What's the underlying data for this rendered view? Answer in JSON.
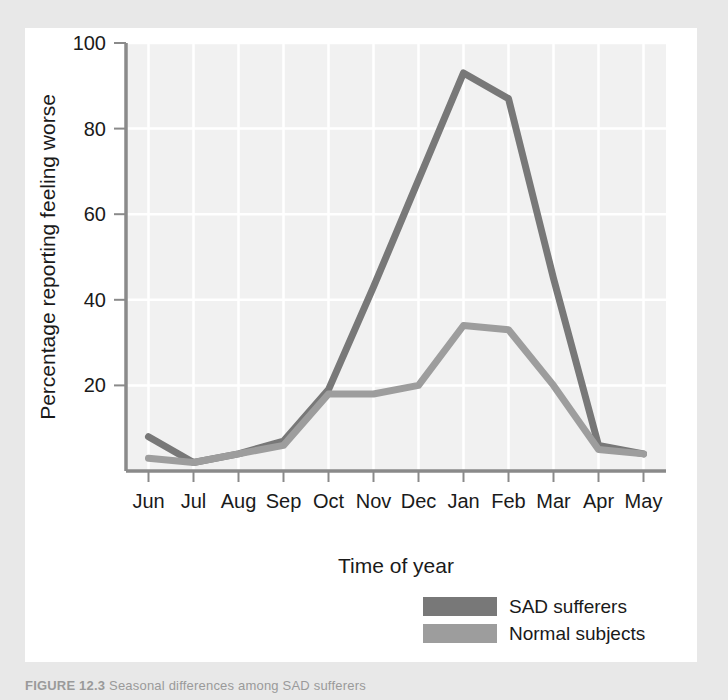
{
  "figure": {
    "caption_label": "FIGURE 12.3",
    "caption_text": "Seasonal differences among SAD sufferers"
  },
  "chart_data": {
    "type": "line",
    "title": "",
    "xlabel": "Time of year",
    "ylabel": "Percentage reporting feeling worse",
    "categories": [
      "Jun",
      "Jul",
      "Aug",
      "Sep",
      "Oct",
      "Nov",
      "Dec",
      "Jan",
      "Feb",
      "Mar",
      "Apr",
      "May"
    ],
    "ylim": [
      0,
      100
    ],
    "yticks": [
      20,
      40,
      60,
      80,
      100
    ],
    "ytick_labels": [
      "20",
      "40",
      "60",
      "80",
      "100"
    ],
    "grid": true,
    "legend_position": "below-right",
    "series": [
      {
        "name": "SAD sufferers",
        "color": "#787878",
        "values": [
          8,
          2,
          4,
          7,
          19,
          43,
          68,
          93,
          87,
          45,
          6,
          4
        ]
      },
      {
        "name": "Normal subjects",
        "color": "#9d9d9d",
        "values": [
          3,
          2,
          4,
          6,
          18,
          18,
          20,
          34,
          33,
          20,
          5,
          4
        ]
      }
    ]
  },
  "style": {
    "page_background": "#e8e8e8",
    "panel_background": "#ffffff",
    "plot_background": "#f1f1f1",
    "gridline_color": "#ffffff",
    "axis_color": "#8a8a8a",
    "text_color": "#1a1a1a"
  }
}
